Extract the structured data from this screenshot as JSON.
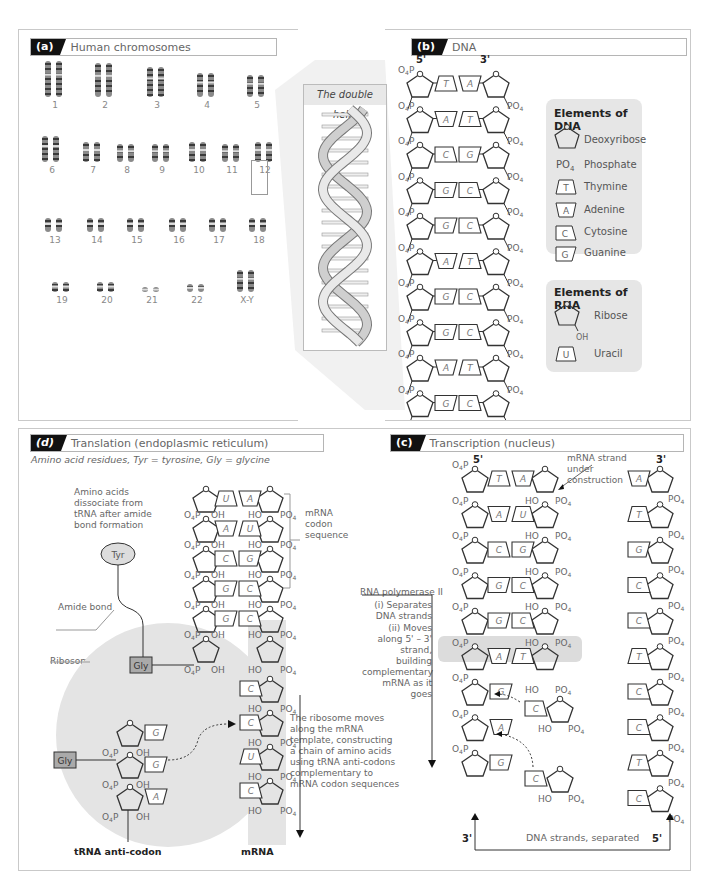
{
  "panels": {
    "a": {
      "badge": "(a)",
      "title": "Human chromosomes",
      "rows": [
        [
          "1",
          "2",
          "3",
          "4",
          "5"
        ],
        [
          "6",
          "7",
          "8",
          "9",
          "10",
          "11",
          "12"
        ],
        [
          "13",
          "14",
          "15",
          "16",
          "17",
          "18"
        ],
        [
          "19",
          "20",
          "21",
          "22",
          "X-Y"
        ]
      ],
      "helix_title": "The double helix"
    },
    "b": {
      "badge": "(b)",
      "title": "DNA",
      "end_left": "5'",
      "end_right": "3'",
      "pairs": [
        [
          "T",
          "A"
        ],
        [
          "A",
          "T"
        ],
        [
          "C",
          "G"
        ],
        [
          "G",
          "C"
        ],
        [
          "G",
          "C"
        ],
        [
          "A",
          "T"
        ],
        [
          "G",
          "C"
        ],
        [
          "G",
          "C"
        ],
        [
          "A",
          "T"
        ],
        [
          "G",
          "C"
        ]
      ],
      "phosphate_left": "O4P",
      "phosphate_right": "PO4",
      "legend_dna": {
        "title": "Elements of DNA",
        "items": [
          {
            "symbol": "pentagon",
            "label": "Deoxyribose"
          },
          {
            "symbol": "PO4",
            "label": "Phosphate"
          },
          {
            "symbol": "T",
            "label": "Thymine"
          },
          {
            "symbol": "A",
            "label": "Adenine"
          },
          {
            "symbol": "C",
            "label": "Cytosine"
          },
          {
            "symbol": "G",
            "label": "Guanine"
          }
        ]
      },
      "legend_rna": {
        "title": "Elements of RNA",
        "items": [
          {
            "symbol": "pentagon-oh",
            "label": "Ribose",
            "sub": "OH"
          },
          {
            "symbol": "U",
            "label": "Uracil"
          }
        ]
      }
    },
    "d": {
      "badge": "(d)",
      "title": "Translation (endoplasmic reticulum)",
      "subtitle": "Amino acid residues, Tyr = tyrosine, Gly = glycine",
      "dissociate_note": "Amino acids dissociate from tRNA after amide bond formation",
      "tyr_label": "Tyr",
      "gly_label": "Gly",
      "amide_bond": "Amide bond",
      "ribosome": "Ribosome",
      "codon_label": "mRNA codon sequence",
      "top_pairs": [
        [
          "U",
          "A"
        ],
        [
          "A",
          "U"
        ],
        [
          "C",
          "G"
        ],
        [
          "G",
          "C"
        ],
        [
          "G",
          "C"
        ]
      ],
      "mrna_singles": [
        "C",
        "C",
        "U",
        "C"
      ],
      "trna_bases": [
        "G",
        "G",
        "A"
      ],
      "ribosome_note": "The ribosome moves along the mRNA template, constructing a chain of amino acids using tRNA anti-codons complementary to mRNA codon sequences",
      "trna_label": "tRNA anti-codon",
      "mrna_label": "mRNA",
      "oh": "OH",
      "ho": "HO"
    },
    "c": {
      "badge": "(c)",
      "title": "Transcription (nucleus)",
      "end_left": "5'",
      "end_right": "3'",
      "mrna_note": "mRNA strand under construction",
      "pairs": [
        [
          "T",
          "A"
        ],
        [
          "A",
          "U"
        ],
        [
          "C",
          "G"
        ],
        [
          "G",
          "C"
        ],
        [
          "G",
          "C"
        ],
        [
          "A",
          "T"
        ]
      ],
      "left_singles": [
        "G",
        "A",
        "G"
      ],
      "free_nucleotides": [
        "C",
        "C"
      ],
      "right_column": [
        "A",
        "T",
        "G",
        "C",
        "C",
        "T",
        "C",
        "C",
        "T",
        "C"
      ],
      "polymerase_title": "RNA polymerase II",
      "polymerase_steps": [
        "(i) Separates DNA strands",
        "(ii) Moves along 5' – 3' strand, building complementary mRNA as it goes"
      ],
      "separated_label": "DNA strands, separated",
      "bottom_left": "3'",
      "bottom_right": "5'"
    }
  }
}
